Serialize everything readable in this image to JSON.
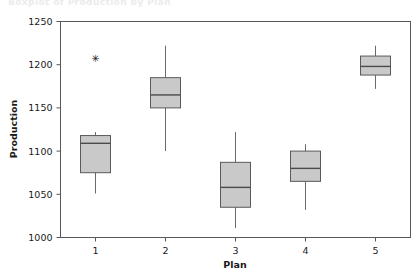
{
  "chart_data": {
    "type": "box",
    "title": "",
    "xlabel": "Plan",
    "ylabel": "Production",
    "categories": [
      "1",
      "2",
      "3",
      "4",
      "5"
    ],
    "ylim": [
      1000,
      1250
    ],
    "yticks": [
      1000,
      1050,
      1100,
      1150,
      1200,
      1250
    ],
    "ytick_labels": [
      "1000",
      "1050",
      "1100",
      "1150",
      "1200",
      "1250"
    ],
    "xtick_labels": [
      "1",
      "2",
      "3",
      "4",
      "5"
    ],
    "grid": false,
    "legend": false,
    "boxes": [
      {
        "category": "1",
        "whisker_low": 1051,
        "q1": 1075,
        "median": 1109,
        "q3": 1118,
        "whisker_high": 1122,
        "outliers": [
          1208
        ]
      },
      {
        "category": "2",
        "whisker_low": 1100,
        "q1": 1150,
        "median": 1165,
        "q3": 1185,
        "whisker_high": 1222,
        "outliers": []
      },
      {
        "category": "3",
        "whisker_low": 1011,
        "q1": 1035,
        "median": 1058,
        "q3": 1087,
        "whisker_high": 1122,
        "outliers": []
      },
      {
        "category": "4",
        "whisker_low": 1032,
        "q1": 1065,
        "median": 1080,
        "q3": 1100,
        "whisker_high": 1108,
        "outliers": []
      },
      {
        "category": "5",
        "whisker_low": 1172,
        "q1": 1188,
        "median": 1198,
        "q3": 1210,
        "whisker_high": 1222,
        "outliers": []
      }
    ],
    "colors": {
      "box_fill": "#c9c9c9",
      "box_stroke": "#5a5a5a",
      "median": "#4a4a4a",
      "whisker": "#6a6a6a",
      "axis": "#58585c",
      "background": "#ffffff"
    }
  },
  "ghost_header": {
    "text": "Boxplot of Production by Plan"
  }
}
